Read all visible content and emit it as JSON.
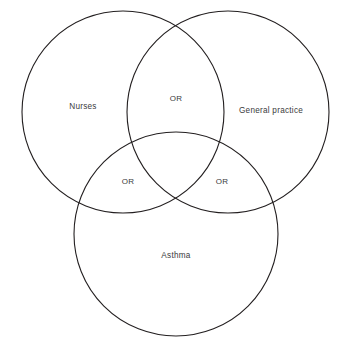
{
  "figure": {
    "type": "venn-diagram-3-set",
    "background_color": "#ffffff",
    "stroke_color": "#231f20",
    "text_color": "#3a3a3c"
  },
  "chart_data": {
    "type": "venn",
    "title": "",
    "sets": [
      {
        "id": "nurses",
        "label": "Nurses",
        "cx": 123,
        "cy": 112,
        "r": 101,
        "label_x": 83,
        "label_y": 107
      },
      {
        "id": "general-practice",
        "label": "General practice",
        "cx": 228,
        "cy": 112,
        "r": 101,
        "label_x": 271,
        "label_y": 111
      },
      {
        "id": "asthma",
        "label": "Asthma",
        "cx": 176,
        "cy": 234,
        "r": 102,
        "label_x": 176,
        "label_y": 256
      }
    ],
    "intersections": [
      {
        "id": "nurses-general-practice",
        "label": "OR",
        "sets": [
          "nurses",
          "general-practice"
        ],
        "label_x": 176,
        "label_y": 99
      },
      {
        "id": "nurses-asthma",
        "label": "OR",
        "sets": [
          "nurses",
          "asthma"
        ],
        "label_x": 128,
        "label_y": 182
      },
      {
        "id": "general-practice-asthma",
        "label": "OR",
        "sets": [
          "general-practice",
          "asthma"
        ],
        "label_x": 222,
        "label_y": 182
      }
    ],
    "center_intersection": {
      "id": "all-three",
      "label": "",
      "sets": [
        "nurses",
        "general-practice",
        "asthma"
      ]
    },
    "legend": "none",
    "grid": false
  }
}
